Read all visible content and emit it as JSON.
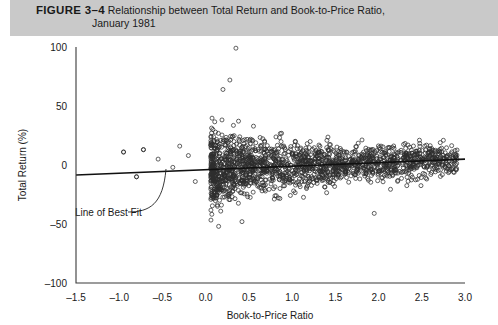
{
  "caption": {
    "figure_number": "FIGURE 3–4",
    "title_line1": "Relationship between Total Return and Book-to-Price Ratio,",
    "title_line2": "January 1981",
    "band_color": "#c9c9c9"
  },
  "chart_data": {
    "type": "scatter",
    "title": "Relationship between Total Return and Book-to-Price Ratio, January 1981",
    "xlabel": "Book-to-Price Ratio",
    "ylabel": "Total Return (%)",
    "xlim": [
      -1.5,
      3.0
    ],
    "ylim": [
      -100,
      100
    ],
    "xticks": [
      -1.5,
      -1.0,
      -0.5,
      0.0,
      0.5,
      1.0,
      1.5,
      2.0,
      2.5,
      3.0
    ],
    "xtick_labels": [
      "–1.5",
      "–1.0",
      "–0.5",
      "0.0",
      "0.5",
      "1.0",
      "1.5",
      "2.0",
      "2.5",
      "3.0"
    ],
    "yticks": [
      -100,
      -50,
      0,
      50,
      100
    ],
    "ytick_labels": [
      "–100",
      "–50",
      "0",
      "50",
      "100"
    ],
    "grid": false,
    "legend": null,
    "marker": {
      "shape": "open-circle",
      "size": 2.0,
      "color": "#2e2e2e"
    },
    "annotations": [
      {
        "text": "Line of Best Fit",
        "x": -1.05,
        "y": -30,
        "points_to": {
          "x": 0.0,
          "y": -4
        }
      }
    ],
    "fit_line": {
      "name": "Line of Best Fit",
      "x_start": -1.5,
      "y_start": -8.5,
      "x_end": 3.0,
      "y_end": 5.0,
      "slope": 3.0,
      "intercept": -4.0
    },
    "series": [
      {
        "name": "Stocks",
        "n_points": 1800,
        "description": "Dense cloud concentrated between book-to-price 0.0 and 3.0, centered near 0 percent total return, widest spread near 0.2-0.8 and narrowing toward 3.0; a handful of sparse points at negative book-to-price ratios.",
        "notable_points": [
          {
            "x": 0.35,
            "y": 99
          },
          {
            "x": 0.28,
            "y": 72
          },
          {
            "x": 0.2,
            "y": 64
          },
          {
            "x": -0.95,
            "y": 11
          },
          {
            "x": -0.72,
            "y": 13
          },
          {
            "x": -0.8,
            "y": -10
          },
          {
            "x": 1.95,
            "y": -41
          },
          {
            "x": 0.15,
            "y": -52
          },
          {
            "x": 0.42,
            "y": -48
          }
        ]
      }
    ]
  }
}
